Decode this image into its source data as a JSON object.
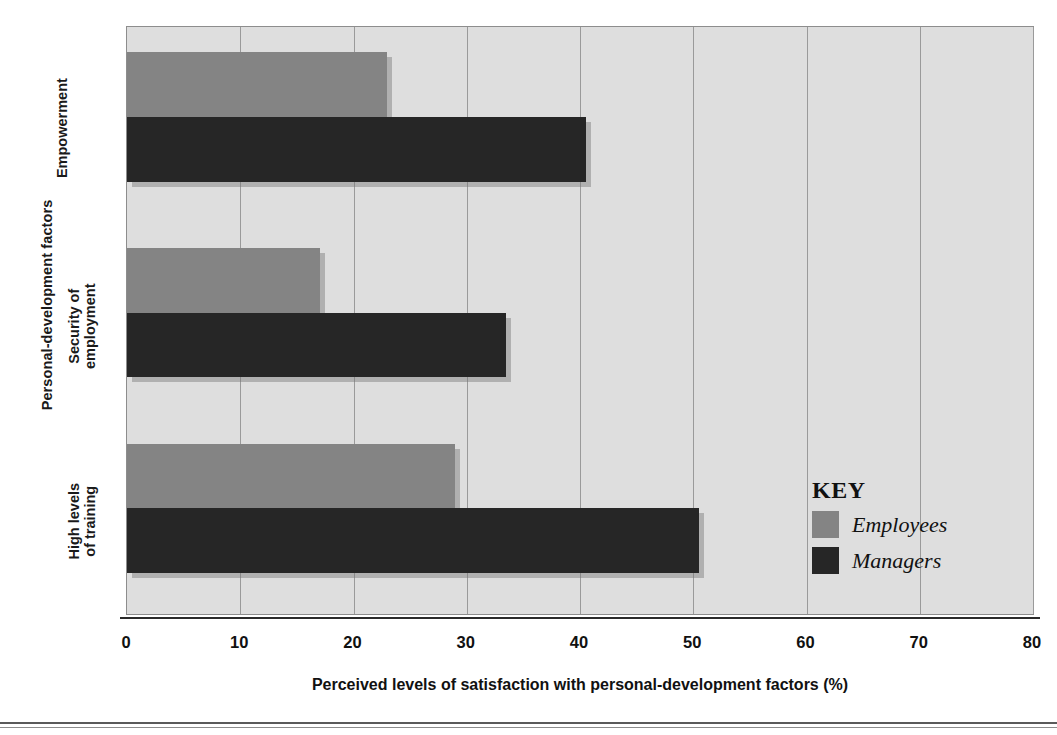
{
  "chart_data": {
    "type": "bar",
    "orientation": "horizontal",
    "title": "",
    "xlabel": "Perceived levels of satisfaction with personal-development factors (%)",
    "ylabel": "Personal-development factors",
    "categories": [
      "High levels\nof training",
      "Security of\nemployment",
      "Empowerment"
    ],
    "categories_plain": [
      "High levels of training",
      "Security of employment",
      "Empowerment"
    ],
    "series": [
      {
        "name": "Employees",
        "values": [
          29,
          17,
          23
        ],
        "color": "#848484"
      },
      {
        "name": "Managers",
        "values": [
          50.5,
          33.5,
          40.5
        ],
        "color": "#262626"
      }
    ],
    "xlim": [
      0,
      80
    ],
    "xticks": [
      0,
      10,
      20,
      30,
      40,
      50,
      60,
      70,
      80
    ],
    "xtick_labels": [
      "0",
      "10",
      "20",
      "30",
      "40",
      "50",
      "60",
      "70",
      "80"
    ],
    "grid": "vertical",
    "legend_position": "inside-bottom-right",
    "plot_background": "#dedede"
  },
  "legend": {
    "title": "KEY",
    "entries": [
      {
        "label": "Employees",
        "swatch": "#848484"
      },
      {
        "label": "Managers",
        "swatch": "#262626"
      }
    ]
  }
}
